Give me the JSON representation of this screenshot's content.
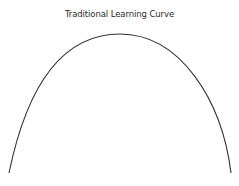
{
  "title": "Traditional Learning Curve",
  "curve": {
    "stroke": "#333333",
    "path": "M9,173 C22,110 50,34 120,34 C180,34 222,100 231,173"
  },
  "chart_data": {
    "type": "line",
    "title": "Traditional Learning Curve",
    "xlabel": "",
    "ylabel": "",
    "x": [
      0,
      0.25,
      0.5,
      0.75,
      1.0
    ],
    "values": [
      0,
      0.75,
      1.0,
      0.75,
      0
    ],
    "grid": false,
    "legend": null
  }
}
